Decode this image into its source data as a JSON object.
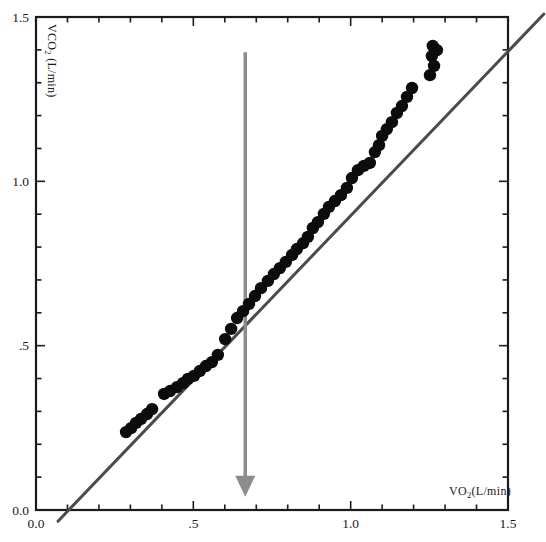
{
  "figure": {
    "background": "#ffffff",
    "frame_color": "#1b1b1b",
    "xlabel": {
      "prefix": "VO",
      "sub": "2",
      "suffix": "(L/min)"
    },
    "ylabel": {
      "prefix": "VCO",
      "sub": "2",
      "suffix": " (L/min)"
    }
  },
  "chart_data": {
    "type": "scatter",
    "title": "",
    "xlabel": "VO2(L/min)",
    "ylabel": "VCO2 (L/min)",
    "xlim": [
      0,
      1.5
    ],
    "ylim": [
      0,
      1.5
    ],
    "grid": false,
    "legend": "none",
    "x_major_ticks": [
      {
        "v": 0.0,
        "label": "0.0"
      },
      {
        "v": 0.5,
        "label": ".5"
      },
      {
        "v": 1.0,
        "label": "1.0"
      },
      {
        "v": 1.5,
        "label": "1.5"
      }
    ],
    "y_major_ticks": [
      {
        "v": 0.0,
        "label": "0.0"
      },
      {
        "v": 0.5,
        "label": ".5"
      },
      {
        "v": 1.0,
        "label": "1.0"
      },
      {
        "v": 1.5,
        "label": "1.5"
      }
    ],
    "minor_tick_step": 0.1,
    "point_color": "#0c0c0c",
    "point_radius_px": 6.2,
    "series": [
      {
        "name": "VCO2 vs VO2 gas exchange points",
        "points": [
          [
            0.286,
            0.237
          ],
          [
            0.302,
            0.249
          ],
          [
            0.318,
            0.265
          ],
          [
            0.334,
            0.277
          ],
          [
            0.353,
            0.292
          ],
          [
            0.369,
            0.307
          ],
          [
            0.407,
            0.353
          ],
          [
            0.426,
            0.362
          ],
          [
            0.448,
            0.374
          ],
          [
            0.467,
            0.386
          ],
          [
            0.483,
            0.399
          ],
          [
            0.502,
            0.408
          ],
          [
            0.521,
            0.423
          ],
          [
            0.54,
            0.438
          ],
          [
            0.559,
            0.45
          ],
          [
            0.578,
            0.472
          ],
          [
            0.601,
            0.52
          ],
          [
            0.62,
            0.551
          ],
          [
            0.639,
            0.584
          ],
          [
            0.658,
            0.605
          ],
          [
            0.677,
            0.627
          ],
          [
            0.696,
            0.651
          ],
          [
            0.715,
            0.675
          ],
          [
            0.737,
            0.697
          ],
          [
            0.756,
            0.718
          ],
          [
            0.775,
            0.736
          ],
          [
            0.794,
            0.755
          ],
          [
            0.814,
            0.776
          ],
          [
            0.829,
            0.794
          ],
          [
            0.849,
            0.812
          ],
          [
            0.864,
            0.831
          ],
          [
            0.88,
            0.858
          ],
          [
            0.896,
            0.876
          ],
          [
            0.915,
            0.901
          ],
          [
            0.931,
            0.922
          ],
          [
            0.95,
            0.94
          ],
          [
            0.969,
            0.958
          ],
          [
            0.988,
            0.98
          ],
          [
            1.004,
            1.01
          ],
          [
            1.023,
            1.034
          ],
          [
            1.042,
            1.047
          ],
          [
            1.061,
            1.056
          ],
          [
            1.077,
            1.089
          ],
          [
            1.09,
            1.11
          ],
          [
            1.1,
            1.138
          ],
          [
            1.115,
            1.159
          ],
          [
            1.131,
            1.18
          ],
          [
            1.147,
            1.208
          ],
          [
            1.163,
            1.229
          ],
          [
            1.179,
            1.257
          ],
          [
            1.195,
            1.284
          ],
          [
            1.252,
            1.323
          ],
          [
            1.265,
            1.351
          ],
          [
            1.258,
            1.381
          ],
          [
            1.274,
            1.399
          ],
          [
            1.261,
            1.412
          ]
        ]
      }
    ],
    "identity_line": {
      "from": [
        0.07,
        -0.034
      ],
      "to": [
        1.614,
        1.509
      ],
      "color": "#4b4b4b",
      "width_px": 3
    },
    "threshold_arrow": {
      "x": 0.665,
      "y_from": 1.393,
      "y_to": 0.04,
      "color": "#8c8c8c",
      "shaft_width_px": 3.5,
      "head_width_px": 20,
      "head_length_px": 21
    },
    "tick_label_color": "#1a1a1a",
    "tick_label_font_px": 13.5
  }
}
